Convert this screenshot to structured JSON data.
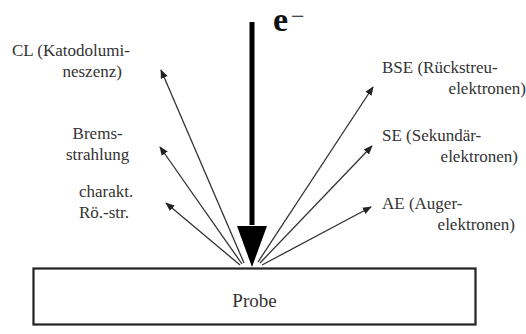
{
  "incident_beam": {
    "label": "e",
    "superscript": "−"
  },
  "sample": {
    "label": "Probe"
  },
  "emissions_left": [
    {
      "id": "cl",
      "lines": [
        "CL (Katodolumi-",
        "neszenz)"
      ]
    },
    {
      "id": "bremsstrahlung",
      "lines": [
        "Brems-",
        "strahlung"
      ]
    },
    {
      "id": "characteristic-xray",
      "lines": [
        "charakt.",
        "Rö.-str."
      ]
    }
  ],
  "emissions_right": [
    {
      "id": "bse",
      "lines": [
        "BSE (Rückstreu-",
        "elektronen)"
      ]
    },
    {
      "id": "se",
      "lines": [
        "SE (Sekundär-",
        "elektronen)"
      ]
    },
    {
      "id": "ae",
      "lines": [
        "AE (Auger-",
        "elektronen)"
      ]
    }
  ],
  "colors": {
    "line": "#333333",
    "beam": "#000000",
    "text": "#333333",
    "background": "#ffffff"
  }
}
